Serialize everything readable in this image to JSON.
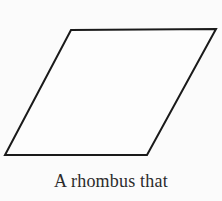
{
  "figure": {
    "shape_name": "rhombus",
    "caption": "A rhombus that",
    "background_color": "#fbfbfb",
    "stroke_color": "#1a1a1a",
    "fill_color": "#fdfdfd",
    "stroke_width": 2,
    "vertices": {
      "top_left": [
        71,
        30
      ],
      "top_right": [
        216,
        29
      ],
      "bottom_right": [
        147,
        155
      ],
      "bottom_left": [
        5,
        155
      ]
    },
    "polygon_points": "71,30 216,29 147,155 5,155"
  }
}
